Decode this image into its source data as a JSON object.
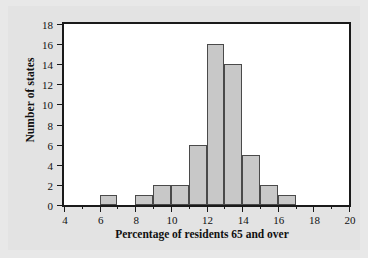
{
  "chart_data": {
    "type": "bar",
    "title": "",
    "xlabel": "Percentage of residents 65 and over",
    "ylabel": "Number of states",
    "xlim": [
      4,
      20
    ],
    "ylim": [
      0,
      18
    ],
    "bin_width": 1,
    "grid": false,
    "legend": null,
    "xticks_major": [
      4,
      6,
      8,
      10,
      12,
      14,
      16,
      18,
      20
    ],
    "xticks_minor": [
      5,
      7,
      9,
      11,
      13,
      15,
      17,
      19
    ],
    "yticks": [
      0,
      2,
      4,
      6,
      8,
      10,
      12,
      14,
      16,
      18
    ],
    "xtick_labels": [
      "4",
      "6",
      "8",
      "10",
      "12",
      "14",
      "16",
      "18",
      "20"
    ],
    "ytick_labels": [
      "0",
      "2",
      "4",
      "6",
      "8",
      "10",
      "12",
      "14",
      "16",
      "18"
    ],
    "bin_edges": [
      4,
      5,
      6,
      7,
      8,
      9,
      10,
      11,
      12,
      13,
      14,
      15,
      16,
      17,
      18,
      19,
      20
    ],
    "categories": [
      "4-5",
      "5-6",
      "6-7",
      "7-8",
      "8-9",
      "9-10",
      "10-11",
      "11-12",
      "12-13",
      "13-14",
      "14-15",
      "15-16",
      "16-17",
      "17-18",
      "18-19",
      "19-20"
    ],
    "values": [
      0,
      0,
      1,
      0,
      1,
      2,
      2,
      6,
      16,
      14,
      5,
      2,
      1,
      0,
      0,
      0
    ],
    "bars": [
      {
        "x0": 6,
        "x1": 7,
        "value": 1
      },
      {
        "x0": 8,
        "x1": 9,
        "value": 1
      },
      {
        "x0": 9,
        "x1": 10,
        "value": 2
      },
      {
        "x0": 10,
        "x1": 11,
        "value": 2
      },
      {
        "x0": 11,
        "x1": 12,
        "value": 6
      },
      {
        "x0": 12,
        "x1": 13,
        "value": 16
      },
      {
        "x0": 13,
        "x1": 14,
        "value": 14
      },
      {
        "x0": 14,
        "x1": 15,
        "value": 5
      },
      {
        "x0": 15,
        "x1": 16,
        "value": 2
      },
      {
        "x0": 16,
        "x1": 17,
        "value": 1
      }
    ],
    "colors": {
      "bar_fill": "#c8c8c8",
      "bar_edge": "#4a4a4a",
      "axis": "#1a1a1a",
      "plot_background": "#ffffff",
      "figure_background": "#e3e3e3",
      "text": "#111111"
    }
  }
}
